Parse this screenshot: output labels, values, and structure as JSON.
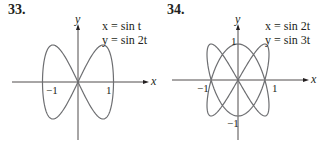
{
  "figures": [
    {
      "number": "33.",
      "equations": {
        "x": "x = sin t",
        "y": "y = sin 2t"
      },
      "axis_labels": {
        "x": "x",
        "y": "y"
      },
      "tick_labels": {
        "x_neg": "−1",
        "x_pos": "1"
      },
      "curve": {
        "x_expr": "sin t",
        "y_expr": "sin 2t"
      }
    },
    {
      "number": "34.",
      "equations": {
        "x": "x = sin 2t",
        "y": "y = sin 3t"
      },
      "axis_labels": {
        "x": "x",
        "y": "y"
      },
      "tick_labels": {
        "x_neg": "−1",
        "x_pos": "1",
        "y_pos": "1",
        "y_neg": "−1"
      },
      "curve": {
        "x_expr": "sin 2t",
        "y_expr": "sin 3t"
      }
    }
  ],
  "colors": {
    "curve": "#6d6e71",
    "axis": "#231f20"
  }
}
